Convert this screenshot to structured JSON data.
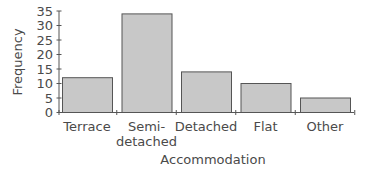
{
  "chart_data": {
    "type": "bar",
    "title": "",
    "xlabel": "Accommodation",
    "ylabel": "Frequency",
    "categories": [
      "Terrace",
      "Semi-detached",
      "Detached",
      "Flat",
      "Other"
    ],
    "category_label_lines": [
      [
        "Terrace"
      ],
      [
        "Semi-",
        "detached"
      ],
      [
        "Detached"
      ],
      [
        "Flat"
      ],
      [
        "Other"
      ]
    ],
    "values": [
      12,
      34,
      14,
      10,
      5
    ],
    "ylim": [
      0,
      35
    ],
    "yticks": [
      0,
      5,
      10,
      15,
      20,
      25,
      30,
      35
    ],
    "grid": false,
    "legend": null
  },
  "colors": {
    "bar_fill": "#c8c8c8",
    "bar_stroke": "#555555",
    "axis": "#555555",
    "text": "#4a4a4a"
  }
}
